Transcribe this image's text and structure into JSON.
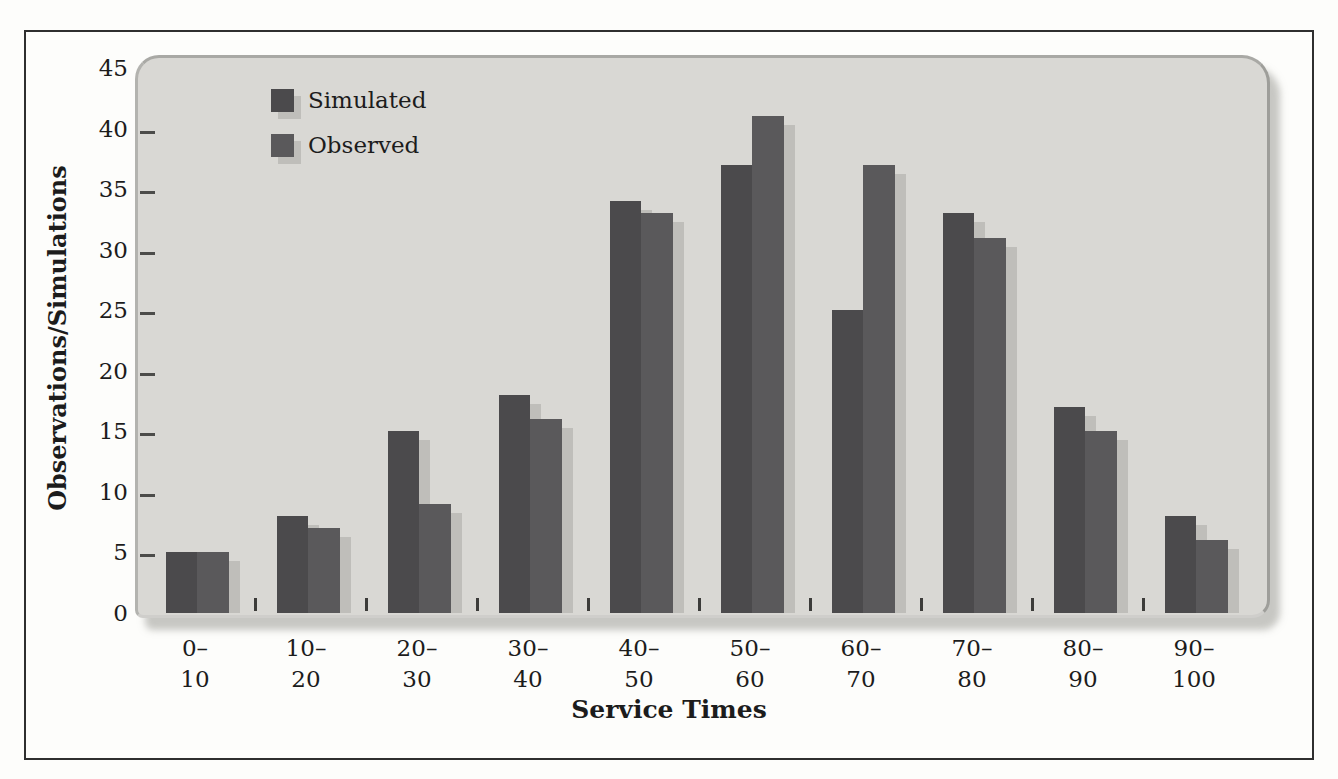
{
  "chart_data": {
    "type": "bar",
    "title": "",
    "xlabel": "Service Times",
    "ylabel": "Observations/Simulations",
    "categories": [
      "0–10",
      "10–20",
      "20–30",
      "30–40",
      "40–50",
      "50–60",
      "60–70",
      "70–80",
      "80–90",
      "90–100"
    ],
    "category_labels": [
      [
        "0–",
        "10"
      ],
      [
        "10–",
        "20"
      ],
      [
        "20–",
        "30"
      ],
      [
        "30–",
        "40"
      ],
      [
        "40–",
        "50"
      ],
      [
        "50–",
        "60"
      ],
      [
        "60–",
        "70"
      ],
      [
        "70–",
        "80"
      ],
      [
        "80–",
        "90"
      ],
      [
        "90–",
        "100"
      ]
    ],
    "series": [
      {
        "name": "Simulated",
        "color": "#4b4a4c",
        "values": [
          5,
          8,
          15,
          18,
          34,
          37,
          25,
          33,
          17,
          8
        ]
      },
      {
        "name": "Observed",
        "color": "#5a595b",
        "values": [
          5,
          7,
          9,
          16,
          33,
          41,
          37,
          31,
          15,
          6
        ]
      }
    ],
    "y_ticks": [
      0,
      5,
      10,
      15,
      20,
      25,
      30,
      35,
      40,
      45
    ],
    "ylim": [
      0,
      45
    ],
    "grid": false,
    "legend_position": "top-left"
  },
  "colors": {
    "panel_background": "#d9d8d4",
    "figure_background": "#fdfdfb",
    "outer_border": "#2f2f2f",
    "bar_shadow": "#bfbeba",
    "text": "#1c1c1c"
  }
}
